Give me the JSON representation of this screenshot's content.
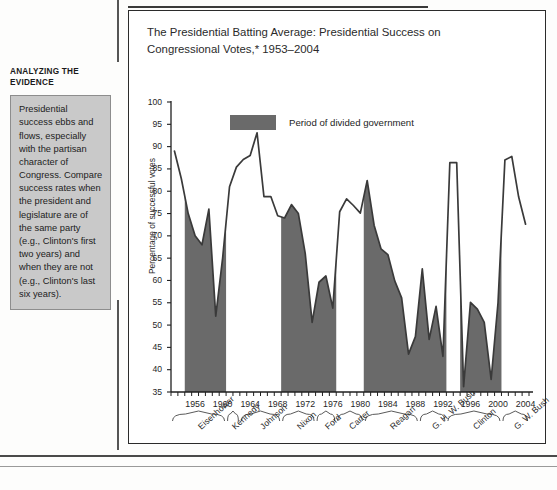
{
  "sidebar": {
    "heading": "ANALYZING THE EVIDENCE",
    "body": "Presidential success ebbs and flows, especially with the partisan character of Congress. Compare success rates when the president and legislature are of the same party (e.g., Clinton's first two years) and when they are not (e.g., Clinton's last six years)."
  },
  "chart_data": {
    "type": "area",
    "title": "The Presidential Batting Average: Presidential Success on Congressional Votes,* 1953–2004",
    "xlabel": "",
    "ylabel": "Percentage of successful votes",
    "ylim": [
      35,
      100
    ],
    "ytick_step": 5,
    "yticks": [
      35,
      40,
      45,
      50,
      55,
      60,
      65,
      70,
      75,
      80,
      85,
      90,
      95,
      100
    ],
    "xlim": [
      1953,
      2004
    ],
    "xticks": [
      1956,
      1960,
      1964,
      1968,
      1972,
      1976,
      1980,
      1984,
      1988,
      1992,
      1996,
      2000,
      2004
    ],
    "grid": false,
    "legend": {
      "position": "top-center",
      "entries": [
        {
          "label": "Period of divided government",
          "color": "#6a6a6a"
        }
      ]
    },
    "series": [
      {
        "name": "Presidential success on congressional votes",
        "x": [
          1953,
          1954,
          1955,
          1956,
          1957,
          1958,
          1959,
          1960,
          1961,
          1962,
          1963,
          1964,
          1965,
          1966,
          1967,
          1968,
          1969,
          1970,
          1971,
          1972,
          1973,
          1974,
          1975,
          1976,
          1977,
          1978,
          1979,
          1980,
          1981,
          1982,
          1983,
          1984,
          1985,
          1986,
          1987,
          1988,
          1989,
          1990,
          1991,
          1992,
          1993,
          1994,
          1995,
          1996,
          1997,
          1998,
          1999,
          2000,
          2001,
          2002,
          2003,
          2004
        ],
        "values": [
          89.0,
          82.8,
          75.0,
          70.0,
          68.0,
          76.0,
          52.0,
          65.0,
          81.0,
          85.4,
          87.1,
          88.0,
          93.1,
          78.8,
          78.8,
          74.5,
          74.0,
          77.0,
          75.0,
          66.0,
          50.6,
          59.6,
          61.0,
          53.8,
          75.4,
          78.3,
          76.8,
          75.1,
          82.4,
          72.4,
          67.1,
          65.8,
          59.9,
          56.1,
          43.5,
          47.4,
          62.6,
          46.8,
          54.2,
          43.0,
          86.4,
          86.4,
          36.2,
          55.1,
          53.6,
          50.6,
          37.8,
          55.0,
          87.0,
          87.8,
          78.7,
          72.6
        ]
      }
    ],
    "shaded_periods": [
      {
        "label": "divided government",
        "start": 1955,
        "end": 1960
      },
      {
        "label": "divided government",
        "start": 1969,
        "end": 1976
      },
      {
        "label": "divided government",
        "start": 1981,
        "end": 1992
      },
      {
        "label": "divided government",
        "start": 1995,
        "end": 2000
      }
    ],
    "presidents": [
      {
        "name": "Eisenhower",
        "start": 1953,
        "end": 1961
      },
      {
        "name": "Kennedy",
        "start": 1961,
        "end": 1963
      },
      {
        "name": "Johnson",
        "start": 1963,
        "end": 1969
      },
      {
        "name": "Nixon",
        "start": 1969,
        "end": 1974
      },
      {
        "name": "Ford",
        "start": 1974,
        "end": 1977
      },
      {
        "name": "Carter",
        "start": 1977,
        "end": 1981
      },
      {
        "name": "Reagan",
        "start": 1981,
        "end": 1989
      },
      {
        "name": "G. H. W. Bush",
        "start": 1989,
        "end": 1993
      },
      {
        "name": "Clinton",
        "start": 1993,
        "end": 2001
      },
      {
        "name": "G. W. Bush",
        "start": 2001,
        "end": 2005
      }
    ],
    "colors": {
      "line": "#3a3a3a",
      "fill": "#6a6a6a",
      "axis": "#1f1f1f",
      "background": "#ffffff"
    }
  }
}
